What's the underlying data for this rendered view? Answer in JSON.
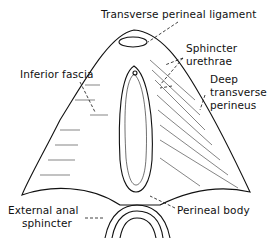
{
  "diagram": {
    "type": "anatomical-illustration",
    "labels": {
      "transverse_perineal_ligament": "Transverse perineal ligament",
      "sphincter_urethrae_1": "Sphincter",
      "sphincter_urethrae_2": "urethrae",
      "inferior_fascia": "Inferior fascia",
      "deep_transverse_1": "Deep",
      "deep_transverse_2": "transverse",
      "deep_transverse_3": "perineus",
      "external_anal_1": "External anal",
      "external_anal_2": "sphincter",
      "perineal_body": "Perineal body"
    },
    "colors": {
      "ink": "#111111",
      "background": "#ffffff"
    }
  }
}
